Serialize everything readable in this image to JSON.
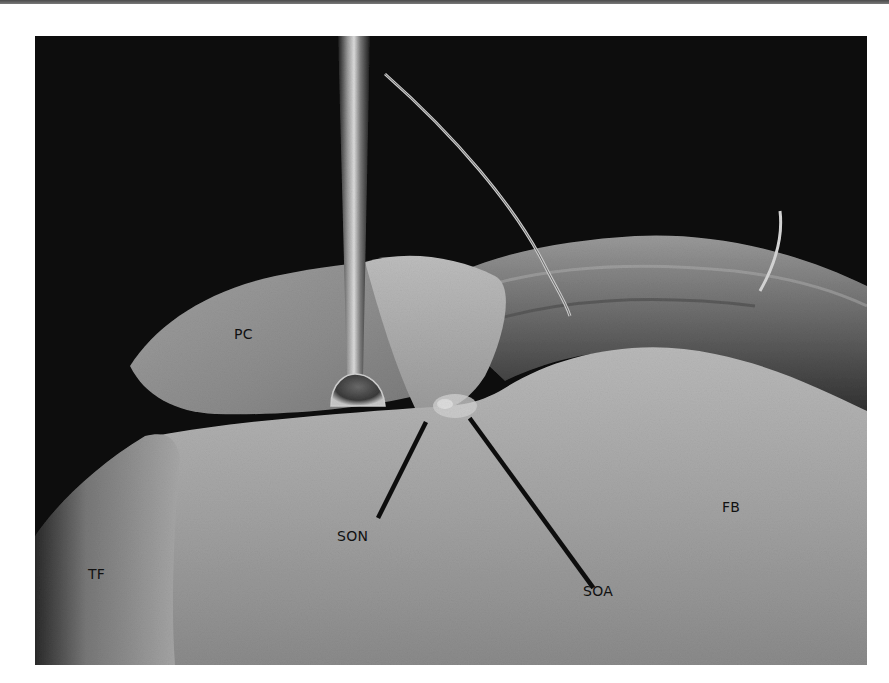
{
  "figure": {
    "type": "grayscale anatomical dissection photograph",
    "labels": {
      "pc": "PC",
      "son": "SON",
      "soa": "SOA",
      "fb": "FB",
      "tf": "TF"
    },
    "colors": {
      "background": "#0a0a0a",
      "tissue_light": "#bdbdbd",
      "tissue_mid": "#8f8f8f",
      "tissue_dark": "#3a3a3a",
      "leader_line": "#0d0d0d",
      "label_text": "#111111"
    }
  }
}
